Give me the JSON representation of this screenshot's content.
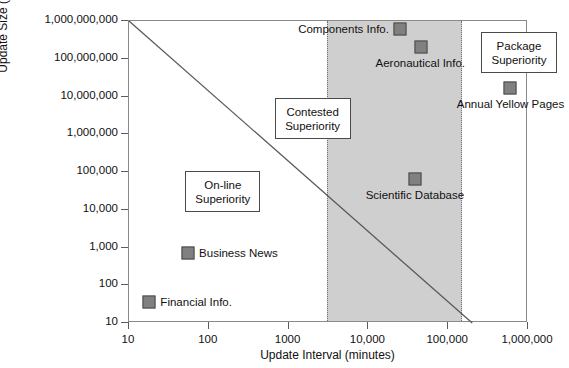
{
  "chart_data": {
    "type": "scatter",
    "title": "",
    "xlabel": "Update Interval (minutes)",
    "ylabel": "Update Size (kilobits)",
    "xscale": "log",
    "yscale": "log",
    "xlim": [
      10,
      1000000
    ],
    "ylim": [
      10,
      1000000000
    ],
    "xticks": [
      "10",
      "100",
      "1000",
      "10,000",
      "100,000",
      "1,000,000"
    ],
    "xtick_values": [
      10,
      100,
      1000,
      10000,
      100000,
      1000000
    ],
    "yticks": [
      "10",
      "100",
      "1,000",
      "10,000",
      "100,000",
      "1,000,000",
      "10,000,000",
      "100,000,000",
      "1,000,000,000"
    ],
    "ytick_values": [
      10,
      100,
      1000,
      10000,
      100000,
      1000000,
      10000000,
      100000000,
      1000000000
    ],
    "grid": false,
    "legend": "none",
    "points": [
      {
        "label": "Financial Info.",
        "x": 18,
        "y": 35,
        "label_pos": "right"
      },
      {
        "label": "Business News",
        "x": 55,
        "y": 700,
        "label_pos": "right"
      },
      {
        "label": "Components Info.",
        "x": 25000,
        "y": 600000000,
        "label_pos": "left"
      },
      {
        "label": "Aeronautical Info.",
        "x": 45000,
        "y": 200000000,
        "label_pos": "below"
      },
      {
        "label": "Annual Yellow Pages",
        "x": 600000,
        "y": 17000000,
        "label_pos": "below"
      },
      {
        "label": "Scientific Database",
        "x": 38000,
        "y": 65000,
        "label_pos": "below"
      }
    ],
    "trend_line": {
      "from": [
        10,
        1000000000
      ],
      "to": [
        200000,
        10
      ],
      "style": "solid"
    },
    "shaded_region": {
      "label": "contested band",
      "x_from": 3000,
      "x_to": 150000,
      "fill": "#cfcfcf",
      "edge": "dotted"
    },
    "annotations": [
      {
        "name": "online-superiority",
        "lines": [
          "On-line",
          "Superiority"
        ]
      },
      {
        "name": "contested-superiority",
        "lines": [
          "Contested",
          "Superiority"
        ]
      },
      {
        "name": "package-superiority",
        "lines": [
          "Package",
          "Superiority"
        ]
      }
    ],
    "colors": {
      "marker_fill": "#808080",
      "marker_edge": "#4a4a4a",
      "band_fill": "#cfcfcf",
      "line": "#5a5a5a",
      "frame": "#8a8a8a",
      "text": "#111111",
      "background": "#ffffff"
    }
  }
}
